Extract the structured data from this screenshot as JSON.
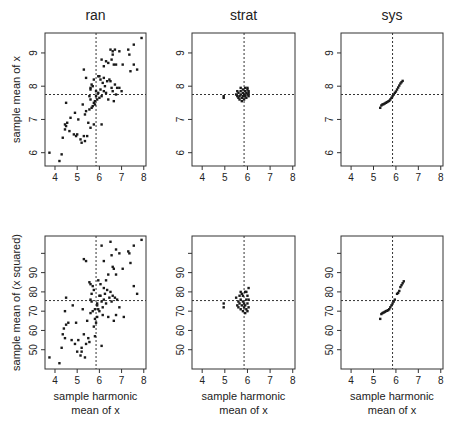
{
  "figure": {
    "column_titles": [
      "ran",
      "strat",
      "sys"
    ],
    "row_ylabels": [
      "sample mean of x",
      "sample mean of (x squared)"
    ],
    "xlabel_lines": [
      "sample harmonic",
      "mean of x"
    ]
  },
  "chart_data": [
    {
      "type": "scatter",
      "title": "ran",
      "row": 0,
      "col": 0,
      "xlabel": "",
      "ylabel": "sample mean of x",
      "xlim": [
        3.55,
        8.1
      ],
      "ylim": [
        5.6,
        9.6
      ],
      "xticks": [
        4,
        5,
        6,
        7,
        8
      ],
      "yticks": [
        6,
        7,
        8,
        9
      ],
      "grid": false,
      "refline_x": 5.85,
      "refline_y": 7.75,
      "points": [
        [
          3.75,
          6.0
        ],
        [
          4.2,
          5.75
        ],
        [
          4.3,
          5.95
        ],
        [
          4.35,
          6.45
        ],
        [
          4.45,
          6.85
        ],
        [
          4.5,
          6.8
        ],
        [
          4.45,
          6.7
        ],
        [
          4.55,
          6.9
        ],
        [
          4.5,
          7.5
        ],
        [
          4.65,
          6.65
        ],
        [
          4.7,
          7.05
        ],
        [
          4.85,
          6.55
        ],
        [
          4.9,
          7.2
        ],
        [
          4.95,
          6.5
        ],
        [
          5.0,
          6.55
        ],
        [
          5.05,
          7.0
        ],
        [
          5.15,
          6.4
        ],
        [
          5.2,
          6.3
        ],
        [
          5.25,
          7.45
        ],
        [
          5.3,
          6.5
        ],
        [
          5.35,
          6.35
        ],
        [
          5.35,
          7.15
        ],
        [
          5.4,
          7.25
        ],
        [
          5.45,
          6.5
        ],
        [
          5.5,
          6.9
        ],
        [
          5.55,
          7.3
        ],
        [
          5.6,
          6.75
        ],
        [
          5.6,
          7.6
        ],
        [
          5.65,
          7.35
        ],
        [
          5.7,
          7.4
        ],
        [
          5.75,
          7.5
        ],
        [
          5.75,
          6.85
        ],
        [
          5.8,
          7.55
        ],
        [
          5.8,
          7.45
        ],
        [
          5.85,
          7.7
        ],
        [
          5.9,
          7.6
        ],
        [
          5.6,
          7.95
        ],
        [
          5.65,
          8.05
        ],
        [
          5.7,
          8.0
        ],
        [
          5.75,
          8.2
        ],
        [
          5.6,
          7.9
        ],
        [
          5.3,
          8.5
        ],
        [
          5.4,
          8.25
        ],
        [
          5.85,
          7.85
        ],
        [
          5.95,
          7.8
        ],
        [
          6.0,
          7.65
        ],
        [
          6.05,
          7.9
        ],
        [
          6.05,
          8.2
        ],
        [
          6.1,
          7.7
        ],
        [
          6.1,
          6.85
        ],
        [
          6.15,
          8.1
        ],
        [
          6.2,
          7.85
        ],
        [
          6.2,
          8.25
        ],
        [
          6.25,
          8.0
        ],
        [
          6.3,
          7.8
        ],
        [
          6.35,
          8.15
        ],
        [
          6.4,
          7.6
        ],
        [
          6.45,
          8.2
        ],
        [
          6.5,
          8.15
        ],
        [
          6.55,
          7.95
        ],
        [
          6.6,
          7.85
        ],
        [
          6.65,
          7.55
        ],
        [
          6.7,
          8.05
        ],
        [
          6.75,
          7.75
        ],
        [
          6.8,
          7.95
        ],
        [
          6.9,
          7.95
        ],
        [
          7.0,
          7.85
        ],
        [
          6.1,
          8.8
        ],
        [
          6.2,
          8.6
        ],
        [
          6.4,
          8.7
        ],
        [
          6.55,
          8.8
        ],
        [
          6.5,
          9.1
        ],
        [
          6.6,
          8.95
        ],
        [
          6.65,
          8.65
        ],
        [
          6.75,
          8.65
        ],
        [
          6.7,
          9.1
        ],
        [
          6.9,
          9.05
        ],
        [
          7.05,
          8.65
        ],
        [
          7.3,
          9.1
        ],
        [
          7.35,
          8.95
        ],
        [
          7.4,
          8.45
        ],
        [
          7.55,
          8.65
        ],
        [
          7.55,
          9.25
        ],
        [
          7.7,
          8.5
        ],
        [
          7.9,
          9.45
        ],
        [
          6.3,
          8.75
        ],
        [
          6.6,
          9.05
        ],
        [
          6.0,
          8.3
        ],
        [
          5.55,
          7.7
        ],
        [
          5.95,
          8.3
        ]
      ]
    },
    {
      "type": "scatter",
      "title": "strat",
      "row": 0,
      "col": 1,
      "xlabel": "",
      "ylabel": "",
      "xlim": [
        3.55,
        8.1
      ],
      "ylim": [
        5.6,
        9.6
      ],
      "xticks": [
        4,
        5,
        6,
        7,
        8
      ],
      "yticks": [
        6,
        7,
        8,
        9
      ],
      "grid": false,
      "refline_x": 5.85,
      "refline_y": 7.75,
      "points": [
        [
          4.95,
          7.65
        ],
        [
          4.95,
          7.7
        ],
        [
          5.5,
          7.75
        ],
        [
          5.55,
          7.7
        ],
        [
          5.6,
          7.65
        ],
        [
          5.6,
          7.8
        ],
        [
          5.65,
          7.7
        ],
        [
          5.65,
          7.6
        ],
        [
          5.7,
          7.75
        ],
        [
          5.7,
          7.85
        ],
        [
          5.75,
          7.65
        ],
        [
          5.75,
          7.55
        ],
        [
          5.8,
          7.7
        ],
        [
          5.8,
          7.8
        ],
        [
          5.8,
          7.9
        ],
        [
          5.85,
          7.6
        ],
        [
          5.85,
          7.75
        ],
        [
          5.9,
          7.7
        ],
        [
          5.9,
          7.85
        ],
        [
          5.95,
          7.8
        ],
        [
          5.95,
          7.65
        ],
        [
          6.0,
          7.75
        ],
        [
          6.0,
          7.9
        ],
        [
          6.0,
          7.95
        ],
        [
          6.05,
          7.8
        ],
        [
          6.05,
          7.7
        ],
        [
          5.7,
          7.95
        ],
        [
          5.9,
          7.95
        ],
        [
          5.55,
          7.85
        ],
        [
          6.05,
          7.85
        ]
      ]
    },
    {
      "type": "scatter",
      "title": "sys",
      "row": 0,
      "col": 2,
      "xlabel": "",
      "ylabel": "",
      "xlim": [
        3.55,
        8.1
      ],
      "ylim": [
        5.6,
        9.6
      ],
      "xticks": [
        4,
        5,
        6,
        7,
        8
      ],
      "yticks": [
        6,
        7,
        8,
        9
      ],
      "grid": false,
      "refline_x": 5.85,
      "refline_y": 7.75,
      "points": [
        [
          5.3,
          7.35
        ],
        [
          5.35,
          7.42
        ],
        [
          5.4,
          7.45
        ],
        [
          5.45,
          7.46
        ],
        [
          5.5,
          7.48
        ],
        [
          5.55,
          7.5
        ],
        [
          5.6,
          7.52
        ],
        [
          5.65,
          7.54
        ],
        [
          5.7,
          7.56
        ],
        [
          5.75,
          7.6
        ],
        [
          5.8,
          7.65
        ],
        [
          5.85,
          7.7
        ],
        [
          5.9,
          7.75
        ],
        [
          5.95,
          7.8
        ],
        [
          6.0,
          7.84
        ],
        [
          6.05,
          7.9
        ],
        [
          6.1,
          7.96
        ],
        [
          6.15,
          8.02
        ],
        [
          6.2,
          8.08
        ],
        [
          6.25,
          8.12
        ],
        [
          6.3,
          8.16
        ]
      ]
    },
    {
      "type": "scatter",
      "title": "",
      "row": 1,
      "col": 0,
      "xlabel": "sample harmonic mean of x",
      "ylabel": "sample mean of (x squared)",
      "xlim": [
        3.55,
        8.1
      ],
      "ylim": [
        40,
        109
      ],
      "xticks": [
        4,
        5,
        6,
        7,
        8
      ],
      "yticks": [
        50,
        60,
        70,
        80,
        90,
        100
      ],
      "ytick_labels": [
        "50",
        "60",
        "70",
        "80",
        "90",
        ""
      ],
      "grid": false,
      "refline_x": 5.85,
      "refline_y": 75.5,
      "points": [
        [
          3.75,
          46
        ],
        [
          4.2,
          43
        ],
        [
          4.3,
          51
        ],
        [
          4.35,
          58
        ],
        [
          4.4,
          61
        ],
        [
          4.45,
          56
        ],
        [
          4.5,
          63
        ],
        [
          4.45,
          70
        ],
        [
          4.5,
          77
        ],
        [
          4.6,
          64
        ],
        [
          4.75,
          55
        ],
        [
          4.8,
          73
        ],
        [
          4.9,
          53
        ],
        [
          4.95,
          64
        ],
        [
          5.0,
          49
        ],
        [
          5.05,
          55
        ],
        [
          5.15,
          47
        ],
        [
          5.2,
          51
        ],
        [
          5.2,
          49
        ],
        [
          5.25,
          71
        ],
        [
          5.3,
          58
        ],
        [
          5.35,
          46
        ],
        [
          5.4,
          53
        ],
        [
          5.45,
          65
        ],
        [
          5.5,
          56
        ],
        [
          5.55,
          54
        ],
        [
          5.6,
          69
        ],
        [
          5.6,
          76
        ],
        [
          5.65,
          75
        ],
        [
          5.7,
          70
        ],
        [
          5.75,
          62
        ],
        [
          5.8,
          66
        ],
        [
          5.8,
          71
        ],
        [
          5.8,
          57
        ],
        [
          5.85,
          64
        ],
        [
          5.9,
          67
        ],
        [
          5.55,
          85
        ],
        [
          5.6,
          84
        ],
        [
          5.65,
          79
        ],
        [
          5.7,
          83
        ],
        [
          5.75,
          81
        ],
        [
          5.3,
          97
        ],
        [
          5.4,
          96
        ],
        [
          5.9,
          73
        ],
        [
          5.95,
          71
        ],
        [
          6.0,
          70
        ],
        [
          6.05,
          78
        ],
        [
          6.05,
          84
        ],
        [
          6.1,
          75
        ],
        [
          6.1,
          52
        ],
        [
          6.15,
          68
        ],
        [
          6.2,
          76
        ],
        [
          6.2,
          82
        ],
        [
          6.25,
          79
        ],
        [
          6.3,
          74
        ],
        [
          6.35,
          81
        ],
        [
          6.4,
          67
        ],
        [
          6.45,
          77
        ],
        [
          6.5,
          80
        ],
        [
          6.55,
          75
        ],
        [
          6.6,
          78
        ],
        [
          6.65,
          65
        ],
        [
          6.7,
          77
        ],
        [
          6.75,
          68
        ],
        [
          6.8,
          76
        ],
        [
          6.9,
          72
        ],
        [
          7.1,
          67
        ],
        [
          6.1,
          104
        ],
        [
          6.2,
          96
        ],
        [
          6.4,
          89
        ],
        [
          6.55,
          99
        ],
        [
          6.5,
          106
        ],
        [
          6.6,
          93
        ],
        [
          6.65,
          92
        ],
        [
          6.75,
          89
        ],
        [
          6.75,
          102
        ],
        [
          6.9,
          100
        ],
        [
          7.05,
          92
        ],
        [
          7.3,
          101
        ],
        [
          7.35,
          100
        ],
        [
          7.4,
          95
        ],
        [
          7.55,
          83
        ],
        [
          7.55,
          104
        ],
        [
          7.7,
          79
        ],
        [
          7.9,
          107
        ],
        [
          6.3,
          86
        ],
        [
          5.95,
          86
        ],
        [
          6.0,
          78
        ],
        [
          6.15,
          72
        ],
        [
          5.9,
          74
        ]
      ]
    },
    {
      "type": "scatter",
      "title": "",
      "row": 1,
      "col": 1,
      "xlabel": "sample harmonic mean of x",
      "ylabel": "",
      "xlim": [
        3.55,
        8.1
      ],
      "ylim": [
        40,
        109
      ],
      "xticks": [
        4,
        5,
        6,
        7,
        8
      ],
      "yticks": [
        50,
        60,
        70,
        80,
        90,
        100
      ],
      "ytick_labels": [
        "50",
        "60",
        "70",
        "80",
        "90",
        ""
      ],
      "grid": false,
      "refline_x": 5.85,
      "refline_y": 75.5,
      "points": [
        [
          4.95,
          74
        ],
        [
          4.95,
          72
        ],
        [
          5.5,
          77
        ],
        [
          5.55,
          73
        ],
        [
          5.6,
          75
        ],
        [
          5.6,
          72
        ],
        [
          5.65,
          74
        ],
        [
          5.7,
          71
        ],
        [
          5.7,
          76
        ],
        [
          5.75,
          73
        ],
        [
          5.75,
          79
        ],
        [
          5.8,
          70
        ],
        [
          5.8,
          75
        ],
        [
          5.8,
          78
        ],
        [
          5.85,
          72
        ],
        [
          5.85,
          74
        ],
        [
          5.9,
          80
        ],
        [
          5.9,
          73
        ],
        [
          5.9,
          69
        ],
        [
          5.95,
          76
        ],
        [
          5.95,
          71
        ],
        [
          6.0,
          74
        ],
        [
          6.0,
          78
        ],
        [
          6.05,
          82
        ],
        [
          6.05,
          72
        ],
        [
          6.05,
          76
        ],
        [
          5.7,
          80
        ],
        [
          5.95,
          80
        ],
        [
          5.65,
          78
        ],
        [
          6.0,
          70
        ]
      ]
    },
    {
      "type": "scatter",
      "title": "",
      "row": 1,
      "col": 2,
      "xlabel": "sample harmonic mean of x",
      "ylabel": "",
      "xlim": [
        3.55,
        8.1
      ],
      "ylim": [
        40,
        109
      ],
      "xticks": [
        4,
        5,
        6,
        7,
        8
      ],
      "yticks": [
        50,
        60,
        70,
        80,
        90,
        100
      ],
      "ytick_labels": [
        "50",
        "60",
        "70",
        "80",
        "90",
        ""
      ],
      "grid": false,
      "refline_x": 5.85,
      "refline_y": 75.5,
      "points": [
        [
          5.3,
          66
        ],
        [
          5.35,
          68.5
        ],
        [
          5.4,
          69
        ],
        [
          5.45,
          69.3
        ],
        [
          5.5,
          69.6
        ],
        [
          5.55,
          70
        ],
        [
          5.6,
          70.2
        ],
        [
          5.65,
          70.5
        ],
        [
          5.7,
          71
        ],
        [
          5.75,
          72
        ],
        [
          5.8,
          73
        ],
        [
          5.85,
          74
        ],
        [
          5.9,
          75
        ],
        [
          5.95,
          76
        ],
        [
          6.05,
          79
        ],
        [
          6.1,
          79.5
        ],
        [
          6.15,
          80.5
        ],
        [
          6.2,
          82.5
        ],
        [
          6.25,
          83.5
        ],
        [
          6.3,
          84.5
        ],
        [
          6.35,
          85.5
        ]
      ]
    }
  ]
}
